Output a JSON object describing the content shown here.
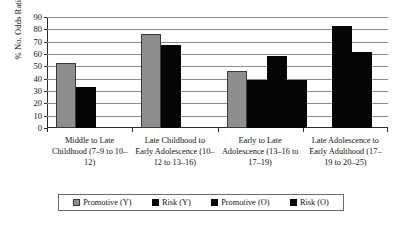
{
  "chart_data": {
    "type": "bar",
    "title": "",
    "xlabel": "",
    "ylabel": "% No. Odds Ratios >2",
    "ylim": [
      0,
      90
    ],
    "ytick_step": 10,
    "yticks": [
      90,
      80,
      70,
      60,
      50,
      40,
      30,
      20,
      10,
      0
    ],
    "grid": true,
    "legend_position": "bottom",
    "categories": [
      "Middle to Late Childhood (7–9 to 10–12)",
      "Late Childhood to Early Adolescence (10–12 to 13–16)",
      "Early to Late Adolescence (13–16 to 17–19)",
      "Late Adolescence to Early Adulthood (17–19 to 20–25)"
    ],
    "series": [
      {
        "name": "Promotive (Y)",
        "color": "#8e8e8e",
        "values": [
          53,
          76,
          46,
          0
        ]
      },
      {
        "name": "Risk (Y)",
        "color": "#050505",
        "values": [
          33,
          67,
          39,
          83
        ]
      },
      {
        "name": "Promotive (O)",
        "color": "#050505",
        "values": [
          0,
          0,
          58,
          62
        ]
      },
      {
        "name": "Risk (O)",
        "color": "#050505",
        "values": [
          0,
          0,
          39,
          0
        ]
      }
    ]
  },
  "legend": {
    "items": [
      {
        "label": "Promotive (Y)",
        "swatch": "gray"
      },
      {
        "label": "Risk (Y)",
        "swatch": "black"
      },
      {
        "label": "Promotive (O)",
        "swatch": "black"
      },
      {
        "label": "Risk (O)",
        "swatch": "black"
      }
    ]
  }
}
